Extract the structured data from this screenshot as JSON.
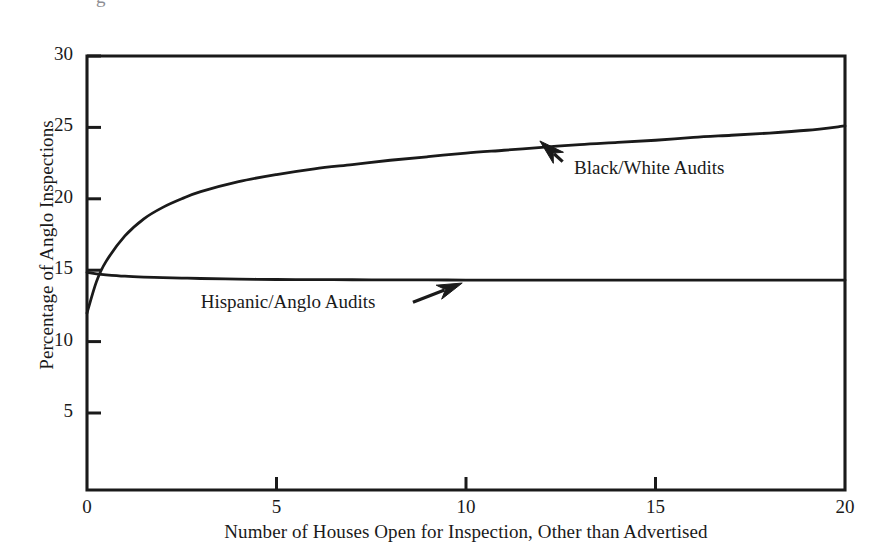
{
  "figure": {
    "background_color": "#ffffff",
    "ink_color": "#1a1a1a",
    "partial_text_top": "g"
  },
  "chart_data": {
    "type": "line",
    "title": "",
    "subtitle": "",
    "xlabel": "Number of Houses Open for Inspection, Other than Advertised",
    "ylabel": "Percentage of Anglo Inspections",
    "xlim": [
      0,
      20
    ],
    "ylim": [
      0,
      30
    ],
    "xticks": [
      0,
      5,
      10,
      15,
      20
    ],
    "xtick_labels": [
      "0",
      "5",
      "10",
      "15",
      "20"
    ],
    "yticks": [
      5,
      10,
      15,
      20,
      25,
      30
    ],
    "ytick_labels": [
      "5",
      "10",
      "15",
      "20",
      "25",
      "30"
    ],
    "grid": false,
    "legend_position": "inline-annotations",
    "axis_style": "box-left-bottom-with-top-and-right-spines",
    "x": [
      0,
      0.25,
      0.5,
      1,
      1.5,
      2,
      2.5,
      3,
      4,
      5,
      6,
      7,
      8,
      9,
      10,
      11,
      12,
      13,
      14,
      15,
      16,
      17,
      18,
      19,
      20
    ],
    "series": [
      {
        "name": "Black/White Audits",
        "label": "Black/White Audits",
        "color": "#1a1a1a",
        "values": [
          12.0,
          14.2,
          15.6,
          17.4,
          18.6,
          19.4,
          20.0,
          20.5,
          21.2,
          21.7,
          22.1,
          22.4,
          22.7,
          22.95,
          23.2,
          23.4,
          23.6,
          23.8,
          23.95,
          24.1,
          24.3,
          24.45,
          24.6,
          24.8,
          25.1
        ]
      },
      {
        "name": "Hispanic/Anglo Audits",
        "label": "Hispanic/Anglo Audits",
        "color": "#1a1a1a",
        "values": [
          14.85,
          14.75,
          14.68,
          14.58,
          14.52,
          14.48,
          14.45,
          14.42,
          14.38,
          14.35,
          14.34,
          14.33,
          14.32,
          14.32,
          14.31,
          14.31,
          14.3,
          14.3,
          14.3,
          14.3,
          14.3,
          14.3,
          14.3,
          14.3,
          14.3
        ]
      }
    ],
    "annotations": [
      {
        "text": "Black/White Audits",
        "text_x": 12.85,
        "text_y": 22.05,
        "arrow_from_x": 12.55,
        "arrow_from_y": 22.6,
        "arrow_to_x": 11.95,
        "arrow_to_y": 24.05
      },
      {
        "text": "Hispanic/Anglo Audits",
        "text_x": 3.0,
        "text_y": 12.6,
        "arrow_from_x": 8.6,
        "arrow_from_y": 12.75,
        "arrow_to_x": 9.9,
        "arrow_to_y": 14.1
      }
    ]
  }
}
